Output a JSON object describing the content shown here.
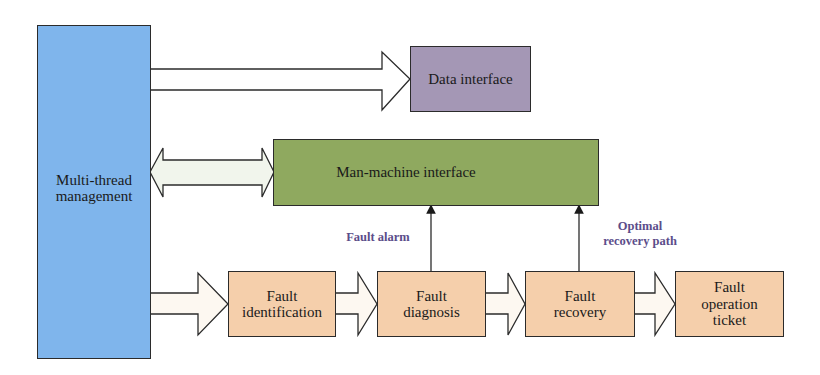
{
  "diagram": {
    "nodes": {
      "multi_thread": {
        "label": "Multi-thread management",
        "line1": "Multi-thread",
        "line2": "management",
        "color": "#7fb5ec"
      },
      "data_interface": {
        "label": "Data interface",
        "color": "#a497b5"
      },
      "man_machine": {
        "label": "Man-machine interface",
        "color": "#8fa95f"
      },
      "fault_identification": {
        "line1": "Fault",
        "line2": "identification",
        "color": "#f5cfab"
      },
      "fault_diagnosis": {
        "line1": "Fault",
        "line2": "diagnosis",
        "color": "#f5cfab"
      },
      "fault_recovery": {
        "line1": "Fault",
        "line2": "recovery",
        "color": "#f5cfab"
      },
      "fault_ticket": {
        "line1": "Fault",
        "line2": "operation",
        "line3": "ticket",
        "color": "#f5cfab"
      }
    },
    "edge_labels": {
      "fault_alarm": "Fault alarm",
      "optimal_line1": "Optimal",
      "optimal_line2": "recovery path"
    },
    "edges": [
      {
        "from": "multi_thread",
        "to": "data_interface",
        "type": "block-arrow"
      },
      {
        "from": "multi_thread",
        "to": "man_machine",
        "type": "double-block-arrow"
      },
      {
        "from": "multi_thread",
        "to": "fault_identification",
        "type": "block-arrow"
      },
      {
        "from": "fault_identification",
        "to": "fault_diagnosis",
        "type": "block-arrow"
      },
      {
        "from": "fault_diagnosis",
        "to": "fault_recovery",
        "type": "block-arrow"
      },
      {
        "from": "fault_recovery",
        "to": "fault_ticket",
        "type": "block-arrow"
      },
      {
        "from": "fault_diagnosis",
        "to": "man_machine",
        "type": "line-arrow",
        "label": "Fault alarm"
      },
      {
        "from": "fault_recovery",
        "to": "man_machine",
        "type": "line-arrow",
        "label": "Optimal recovery path"
      }
    ]
  }
}
